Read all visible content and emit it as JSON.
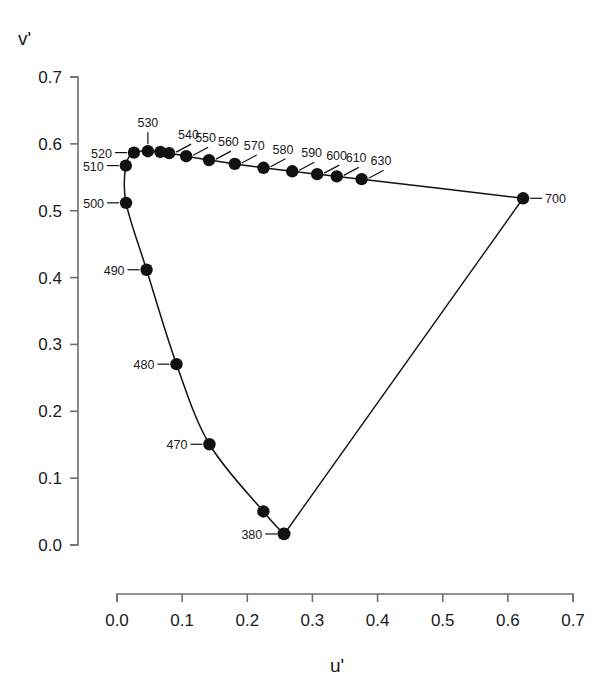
{
  "figure": {
    "title_y": "v'",
    "title_x": "u'",
    "background": "#ffffff",
    "ink_color": "#111111",
    "axis_color": "#6e6e6e"
  },
  "axes": {
    "x": {
      "label": "u'",
      "ticks": [
        "0.0",
        "0.1",
        "0.2",
        "0.3",
        "0.4",
        "0.5",
        "0.6",
        "0.7"
      ],
      "min": 0.0,
      "max": 0.7
    },
    "y": {
      "label": "v'",
      "ticks": [
        "0.0",
        "0.1",
        "0.2",
        "0.3",
        "0.4",
        "0.5",
        "0.6",
        "0.7"
      ],
      "min": 0.0,
      "max": 0.7
    }
  },
  "chart_data": {
    "type": "line",
    "title": "",
    "xlabel": "u'",
    "ylabel": "v'",
    "xlim": [
      0.0,
      0.7
    ],
    "ylim": [
      0.0,
      0.7
    ],
    "grid": false,
    "legend": "none",
    "series": [
      {
        "name": "spectral locus",
        "marker": "filled-circle",
        "points": [
          {
            "label": "380",
            "wavelength": 380,
            "u": 0.2568,
            "v": 0.0165,
            "label_pos": "left"
          },
          {
            "label": "",
            "wavelength": 400,
            "u": 0.2558,
            "v": 0.0168,
            "label_pos": "none"
          },
          {
            "label": "",
            "wavelength": 440,
            "u": 0.2247,
            "v": 0.0502,
            "label_pos": "none"
          },
          {
            "label": "470",
            "wavelength": 470,
            "u": 0.1419,
            "v": 0.1507,
            "label_pos": "left"
          },
          {
            "label": "480",
            "wavelength": 480,
            "u": 0.0913,
            "v": 0.2705,
            "label_pos": "left"
          },
          {
            "label": "490",
            "wavelength": 490,
            "u": 0.0454,
            "v": 0.4117,
            "label_pos": "left"
          },
          {
            "label": "500",
            "wavelength": 500,
            "u": 0.0139,
            "v": 0.5118,
            "label_pos": "left"
          },
          {
            "label": "510",
            "wavelength": 510,
            "u": 0.0135,
            "v": 0.5675,
            "label_pos": "left"
          },
          {
            "label": "520",
            "wavelength": 520,
            "u": 0.026,
            "v": 0.5869,
            "label_pos": "left"
          },
          {
            "label": "530",
            "wavelength": 530,
            "u": 0.0474,
            "v": 0.589,
            "label_pos": "top"
          },
          {
            "label": "",
            "wavelength": 535,
            "u": 0.0666,
            "v": 0.5879,
            "label_pos": "none"
          },
          {
            "label": "540",
            "wavelength": 540,
            "u": 0.08,
            "v": 0.5861,
            "label_pos": "top-right"
          },
          {
            "label": "550",
            "wavelength": 550,
            "u": 0.1062,
            "v": 0.5815,
            "label_pos": "top-right"
          },
          {
            "label": "560",
            "wavelength": 560,
            "u": 0.1412,
            "v": 0.5757,
            "label_pos": "top-right"
          },
          {
            "label": "570",
            "wavelength": 570,
            "u": 0.1808,
            "v": 0.57,
            "label_pos": "top-right"
          },
          {
            "label": "580",
            "wavelength": 580,
            "u": 0.2249,
            "v": 0.5642,
            "label_pos": "top-right"
          },
          {
            "label": "590",
            "wavelength": 590,
            "u": 0.269,
            "v": 0.559,
            "label_pos": "top-right"
          },
          {
            "label": "600",
            "wavelength": 600,
            "u": 0.3073,
            "v": 0.5547,
            "label_pos": "top-right"
          },
          {
            "label": "610",
            "wavelength": 610,
            "u": 0.3373,
            "v": 0.5514,
            "label_pos": "top-right"
          },
          {
            "label": "630",
            "wavelength": 630,
            "u": 0.3755,
            "v": 0.5472,
            "label_pos": "top-right"
          },
          {
            "label": "700",
            "wavelength": 700,
            "u": 0.6234,
            "v": 0.5186,
            "label_pos": "right"
          }
        ]
      }
    ],
    "purple_line": {
      "name": "line of purples",
      "from": "700",
      "to": "380"
    }
  }
}
